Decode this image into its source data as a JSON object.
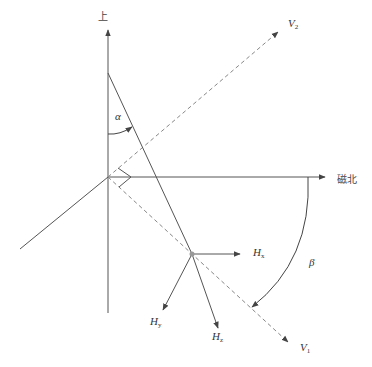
{
  "diagram": {
    "labels": {
      "up": "上",
      "magnetic_north": "磁北",
      "v2": {
        "base": "V",
        "sub": "2"
      },
      "v1": {
        "base": "V",
        "sub": "1"
      },
      "alpha": "α",
      "beta": "β",
      "hx": {
        "base": "H",
        "sub": "x"
      },
      "hy": {
        "base": "H",
        "sub": "y"
      },
      "hz": {
        "base": "H",
        "sub": "z"
      }
    },
    "colors": {
      "line": "#555555",
      "dashed": "#888888",
      "junction": "#999999"
    }
  }
}
